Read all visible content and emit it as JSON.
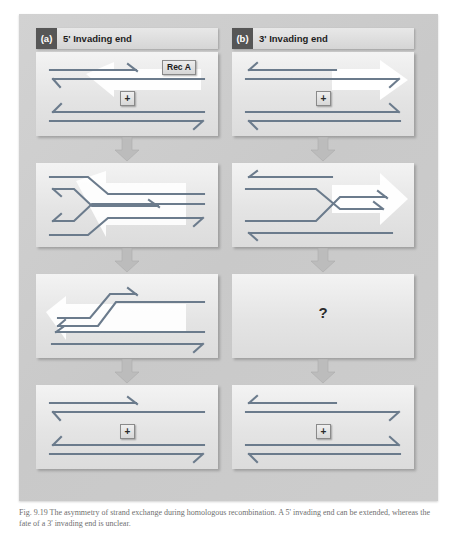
{
  "figure": {
    "background_color": "#cfcfcf",
    "strand_color": "#6b7b8c",
    "reca_arrow_color": "#ffffff",
    "connector_color": "#b9b9b9",
    "tag_color": "#565656"
  },
  "caption": {
    "text": "Fig. 9.19  The asymmetry of strand exchange during homologous recombination. A 5' invading end can be extended, whereas the fate of a 3' invading end is unclear."
  },
  "panels": [
    {
      "tag": "(a)",
      "title": "5' Invading end",
      "tag_name": "panel-a",
      "steps": [
        {
          "name": "step-1",
          "plus_label": "+",
          "reca_label": "Rec A",
          "reca_direction": "left",
          "question": null
        },
        {
          "name": "step-2",
          "plus_label": null,
          "reca_label": null,
          "reca_direction": "left",
          "question": null
        },
        {
          "name": "step-3",
          "plus_label": null,
          "reca_label": null,
          "reca_direction": "left",
          "question": null
        },
        {
          "name": "step-4",
          "plus_label": "+",
          "reca_label": null,
          "reca_direction": null,
          "question": null
        }
      ]
    },
    {
      "tag": "(b)",
      "title": "3' Invading end",
      "tag_name": "panel-b",
      "steps": [
        {
          "name": "step-1",
          "plus_label": "+",
          "reca_label": null,
          "reca_direction": "right",
          "question": null
        },
        {
          "name": "step-2",
          "plus_label": null,
          "reca_label": null,
          "reca_direction": "right",
          "question": null
        },
        {
          "name": "step-3",
          "plus_label": null,
          "reca_label": null,
          "reca_direction": null,
          "question": "?"
        },
        {
          "name": "step-4",
          "plus_label": "+",
          "reca_label": null,
          "reca_direction": null,
          "question": null
        }
      ]
    }
  ]
}
